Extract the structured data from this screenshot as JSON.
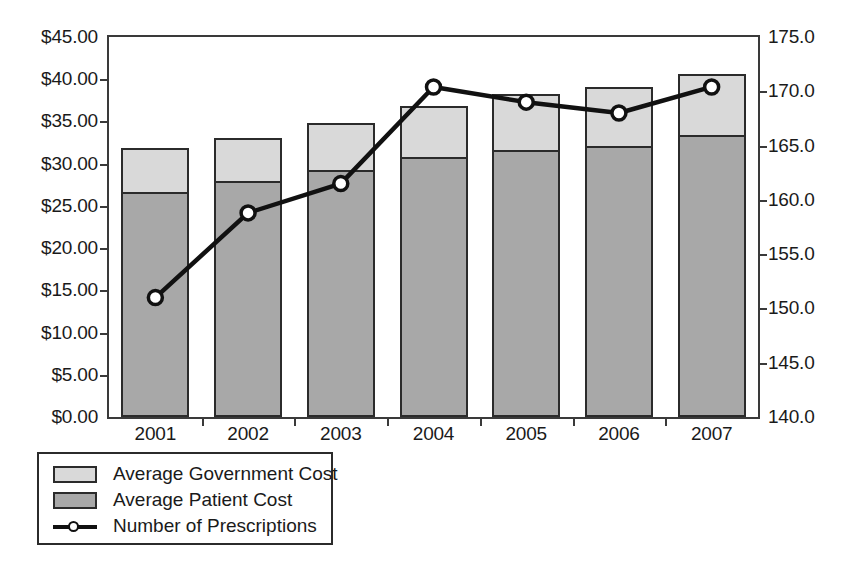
{
  "chart_data": {
    "type": "bar",
    "title": "",
    "subtitle": "",
    "xlabel": "",
    "ylabel": "",
    "categories": [
      "2001",
      "2002",
      "2003",
      "2004",
      "2005",
      "2006",
      "2007"
    ],
    "series": [
      {
        "name": "Average Patient Cost",
        "axis": "left",
        "kind": "bar-stacked",
        "color": "#a8a8a8",
        "values": [
          26.7,
          27.9,
          29.2,
          30.8,
          31.6,
          32.1,
          33.4
        ]
      },
      {
        "name": "Average Government Cost",
        "axis": "left",
        "kind": "bar-stacked",
        "color": "#d9d9d9",
        "values": [
          5.1,
          5.1,
          5.6,
          6.0,
          6.6,
          7.0,
          7.2
        ]
      },
      {
        "name": "Number of Prescriptions",
        "axis": "right",
        "kind": "line",
        "color": "#111111",
        "marker": "open-circle",
        "values": [
          151.0,
          158.8,
          161.5,
          170.4,
          169.0,
          168.0,
          170.4
        ]
      }
    ],
    "stack_totals": [
      31.8,
      33.0,
      34.8,
      36.8,
      38.2,
      39.1,
      40.6
    ],
    "left_axis": {
      "label": "",
      "ticks": [
        "$0.00",
        "$5.00",
        "$10.00",
        "$15.00",
        "$20.00",
        "$25.00",
        "$30.00",
        "$35.00",
        "$40.00",
        "$45.00"
      ],
      "values": [
        0,
        5,
        10,
        15,
        20,
        25,
        30,
        35,
        40,
        45
      ],
      "min": 0,
      "max": 45,
      "step": 5,
      "format": "currency"
    },
    "right_axis": {
      "label": "",
      "ticks": [
        "140.0",
        "145.0",
        "150.0",
        "155.0",
        "160.0",
        "165.0",
        "170.0",
        "175.0"
      ],
      "values": [
        140,
        145,
        150,
        155,
        160,
        165,
        170,
        175
      ],
      "min": 140,
      "max": 175,
      "step": 5,
      "format": "decimal-1"
    },
    "grid": false,
    "legend_position": "below-left",
    "legend": [
      {
        "label": "Average Government Cost",
        "swatch": "light-gray-box"
      },
      {
        "label": "Average Patient Cost",
        "swatch": "dark-gray-box"
      },
      {
        "label": "Number of Prescriptions",
        "swatch": "line-with-open-circle"
      }
    ],
    "colors": {
      "government": "#d9d9d9",
      "patient": "#a8a8a8",
      "line": "#111111",
      "axis": "#3a3a3a",
      "background": "#ffffff"
    }
  }
}
